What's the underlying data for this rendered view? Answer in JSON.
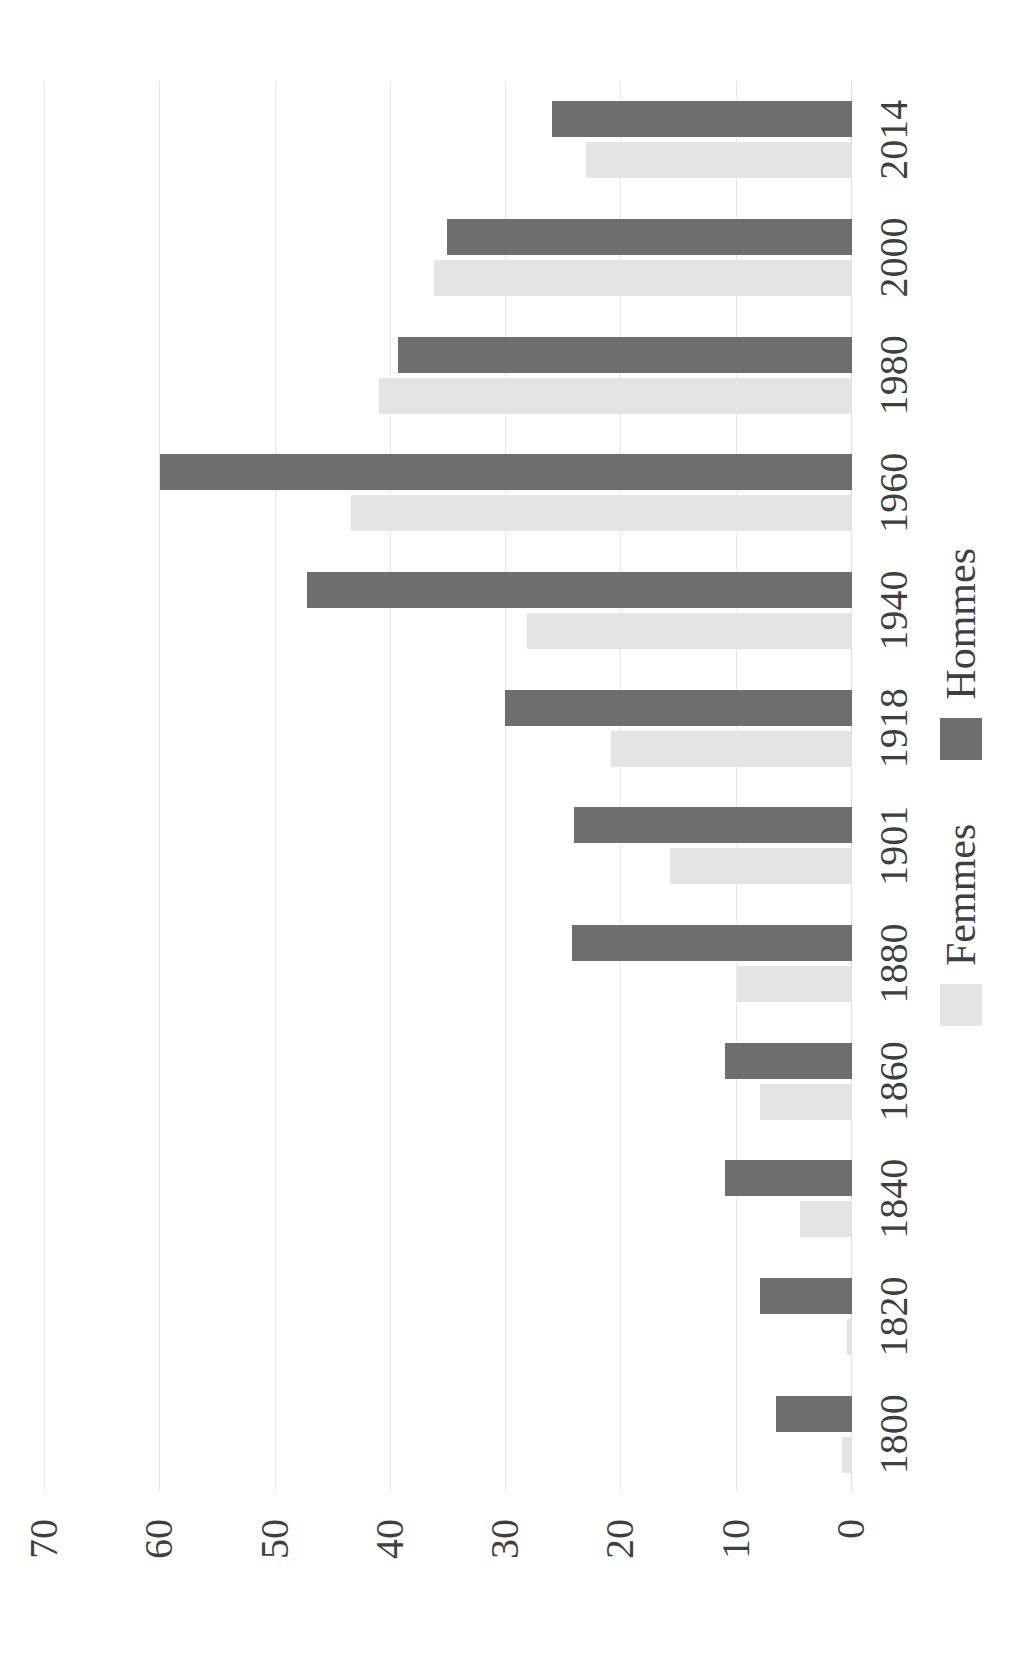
{
  "chart_data": {
    "type": "bar",
    "orientation": "horizontal-rotated",
    "title": "",
    "subtitle": "",
    "xlabel": "",
    "ylabel": "",
    "categories": [
      "1800",
      "1820",
      "1840",
      "1860",
      "1880",
      "1901",
      "1918",
      "1940",
      "1960",
      "1980",
      "2000",
      "2014"
    ],
    "series": [
      {
        "name": "Femmes",
        "color": "#e4e4e4",
        "values": [
          0.9,
          0.4,
          4.5,
          8.0,
          10.0,
          15.8,
          20.9,
          28.2,
          43.5,
          41.0,
          36.3,
          23.1
        ]
      },
      {
        "name": "Hommes",
        "color": "#6e6e6e",
        "values": [
          6.6,
          8.0,
          11.0,
          11.0,
          24.3,
          24.1,
          30.1,
          47.3,
          60.0,
          39.4,
          35.1,
          26.0
        ]
      }
    ],
    "ylim": [
      0,
      70
    ],
    "yticks": [
      "70",
      "60",
      "50",
      "40",
      "30",
      "20",
      "10",
      "0"
    ],
    "ytick_values": [
      70,
      60,
      50,
      40,
      30,
      20,
      10,
      0
    ],
    "grid": true,
    "legend_position": "bottom"
  },
  "legend": {
    "items": [
      {
        "label": "Femmes",
        "swatch": "femmes"
      },
      {
        "label": "Hommes",
        "swatch": "hommes"
      }
    ]
  },
  "colors": {
    "femmes": "#e4e4e4",
    "hommes": "#6e6e6e",
    "grid": "#e8e8e8",
    "text": "#3f3f3f",
    "background": "#ffffff"
  }
}
